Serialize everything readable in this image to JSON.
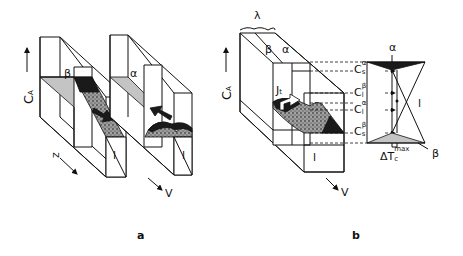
{
  "figure": {
    "panels": [
      {
        "id": "a",
        "label": "a",
        "axis_vertical": "C",
        "axis_vertical_sub": "A",
        "axis_z": "z",
        "axis_v": "V",
        "phase_left_top": "β",
        "phase_right_top": "α",
        "phase_liquid_left": "l",
        "phase_liquid_right": "l"
      },
      {
        "id": "b",
        "label": "b",
        "axis_vertical": "C",
        "axis_vertical_sub": "A",
        "spacing": "λ",
        "phase_beta": "β",
        "phase_alpha": "α",
        "flux": "J",
        "flux_sub": "t",
        "phase_liquid": "l",
        "axis_v": "V",
        "phase_diagram": {
          "alpha_label": "α",
          "beta_label": "β",
          "liquid_label": "l",
          "levels": [
            {
              "main": "C",
              "sup": "α",
              "sub": "s"
            },
            {
              "main": "C",
              "sup": "β",
              "sub": "l"
            },
            {
              "main": "C",
              "sup": "α",
              "sub": "l"
            },
            {
              "main": "C",
              "sup": "β",
              "sub": "s"
            }
          ],
          "undercooling_main": "ΔT",
          "undercooling_sub": "c",
          "undercooling_sup": "max"
        }
      }
    ],
    "colors": {
      "ink": "#111111",
      "shaded_plane": "#c4c4c4",
      "background": "#ffffff"
    }
  }
}
